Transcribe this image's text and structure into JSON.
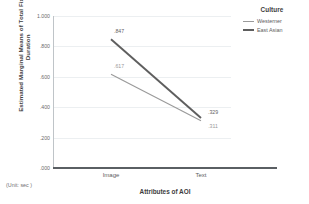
{
  "chart_data": {
    "type": "line",
    "title": "",
    "xlabel": "Attributes of AOI",
    "ylabel": "Estimated Marginal Means of Total Fixation Duration",
    "categories": [
      "Image",
      "Text"
    ],
    "ylim": [
      0.0,
      1.0
    ],
    "yticks": [
      ".000",
      ".200",
      ".400",
      ".600",
      ".800",
      "1.000"
    ],
    "ytick_values": [
      0.0,
      0.2,
      0.4,
      0.6,
      0.8,
      1.0
    ],
    "grid": true,
    "legend_position": "right",
    "legend_title": "Culture",
    "unit_note": "(Unit: sec )",
    "series": [
      {
        "name": "Westerner",
        "color": "#9a9a9a",
        "width": 1.1,
        "values": [
          0.617,
          0.311
        ],
        "labels": [
          ".617",
          ".311"
        ]
      },
      {
        "name": "East Asian",
        "color": "#5e5e5e",
        "width": 1.9,
        "values": [
          0.847,
          0.329
        ],
        "labels": [
          ".847",
          ".329"
        ]
      }
    ]
  },
  "axis": {
    "y_title": "Estimated Marginal Means of Total Fixation Duration",
    "x_title": "Attributes of AOI",
    "ytick_0": ".000",
    "ytick_1": ".200",
    "ytick_2": ".400",
    "ytick_3": ".600",
    "ytick_4": ".800",
    "ytick_5": "1.000",
    "xcat_0": "Image",
    "xcat_1": "Text"
  },
  "legend": {
    "title": "Culture",
    "items": [
      {
        "label": "Westerner",
        "color": "#9a9a9a"
      },
      {
        "label": "East Asian",
        "color": "#5e5e5e"
      }
    ]
  },
  "labels": {
    "east_image": ".847",
    "east_text": ".329",
    "west_image": ".617",
    "west_text": ".311",
    "unit_note": "(Unit: sec )"
  }
}
